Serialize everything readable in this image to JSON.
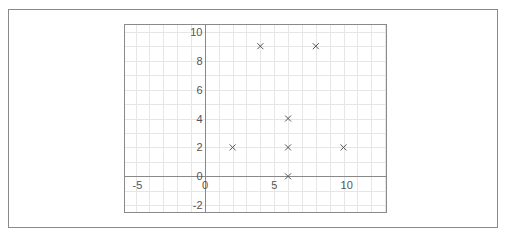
{
  "chart_data": {
    "type": "scatter",
    "title": "",
    "xlabel": "",
    "ylabel": "",
    "xlim": [
      -5.8,
      13.1
    ],
    "ylim": [
      -2.5,
      10.5
    ],
    "grid": true,
    "x_ticks": [
      -5,
      0,
      5,
      10
    ],
    "y_ticks": [
      -2,
      0,
      2,
      4,
      6,
      8,
      10
    ],
    "marker": "x",
    "points": [
      {
        "x": 2,
        "y": 2
      },
      {
        "x": 4,
        "y": 9
      },
      {
        "x": 8,
        "y": 9
      },
      {
        "x": 6,
        "y": 4
      },
      {
        "x": 6,
        "y": 2
      },
      {
        "x": 10,
        "y": 2
      },
      {
        "x": 6,
        "y": 0
      }
    ],
    "colors": {
      "grid": "#e6e6e6",
      "axis": "#888888",
      "marker": "#555555",
      "frame": "#8a8a8a"
    }
  }
}
